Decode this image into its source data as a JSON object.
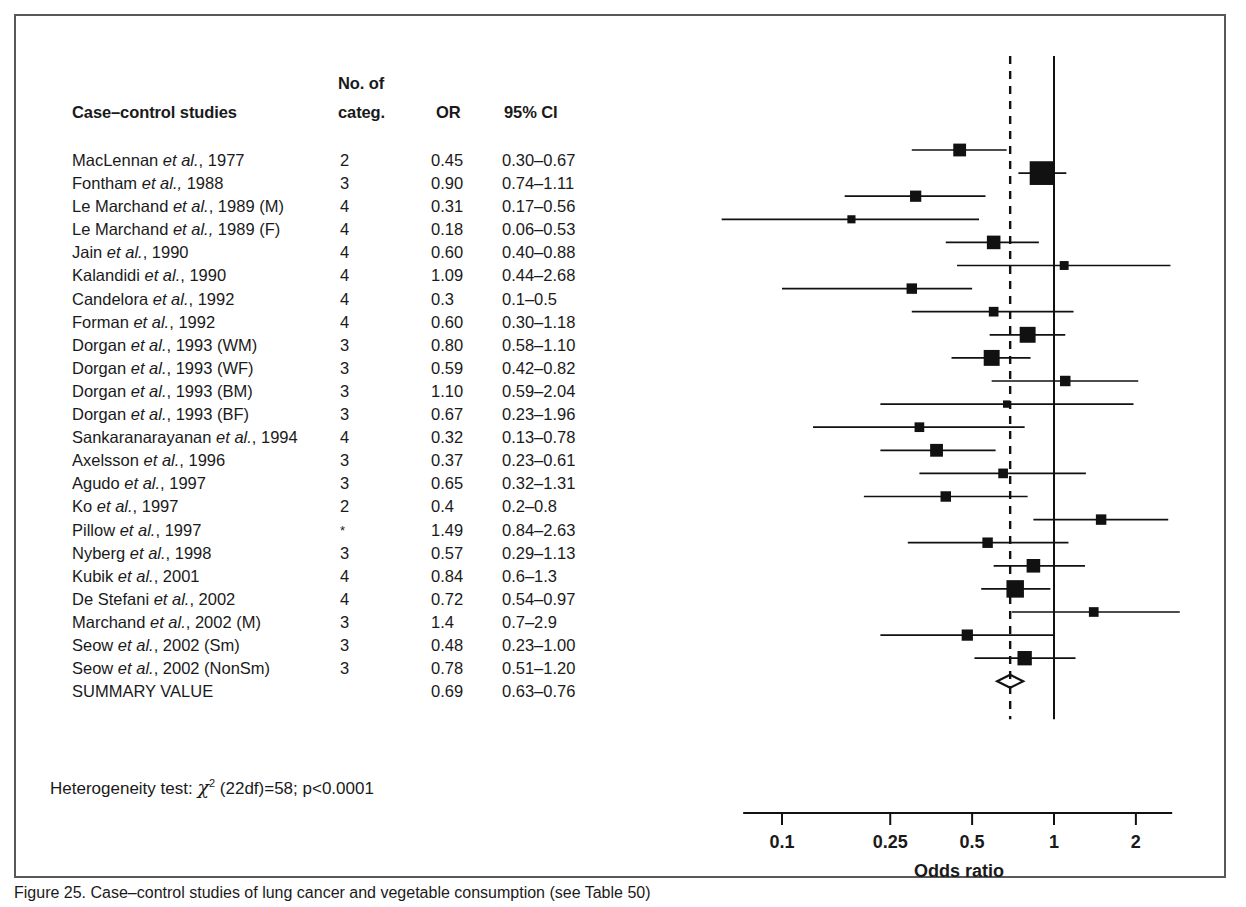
{
  "figure": {
    "caption": "Figure 25. Case–control studies of lung cancer and vegetable consumption (see Table 50)"
  },
  "table": {
    "headers": {
      "studies": "Case–control studies",
      "no_of": "No. of",
      "categ": "categ.",
      "or": "OR",
      "ci": "95% CI"
    }
  },
  "heterogeneity": {
    "prefix": "Heterogeneity test:",
    "chi": "χ",
    "sup": "2",
    "rest": "(22df)=58; p<0.0001"
  },
  "axis": {
    "label": "Odds ratio",
    "ticks": [
      "0.1",
      "0.25",
      "0.5",
      "1",
      "2"
    ],
    "tick_values": [
      0.1,
      0.25,
      0.5,
      1,
      2
    ],
    "scale": "log",
    "null_line": 1.0,
    "summary_line": 0.69
  },
  "chart_data": {
    "type": "forest",
    "title": "Case–control studies of lung cancer and vegetable consumption",
    "xlabel": "Odds ratio",
    "xscale": "log",
    "xlim": [
      0.07,
      2.6
    ],
    "xticks": [
      0.1,
      0.25,
      0.5,
      1,
      2
    ],
    "reference_line": 1.0,
    "summary_line": 0.69,
    "grid": false,
    "legend": "none",
    "rows": [
      {
        "study": "MacLennan ",
        "italic": "et al.",
        "tail": ", 1977",
        "categ": "2",
        "or": "0.45",
        "ci": "0.30–0.67",
        "lo": 0.3,
        "hi": 0.67,
        "est": 0.45,
        "weight": 10
      },
      {
        "study": "Fontham ",
        "italic": "et al.,",
        "tail": " 1988",
        "categ": "3",
        "or": "0.90",
        "ci": "0.74–1.11",
        "lo": 0.74,
        "hi": 1.11,
        "est": 0.9,
        "weight": 24
      },
      {
        "study": "Le Marchand ",
        "italic": "et al.",
        "tail": ", 1989 (M)",
        "categ": "4",
        "or": "0.31",
        "ci": "0.17–0.56",
        "lo": 0.17,
        "hi": 0.56,
        "est": 0.31,
        "weight": 8
      },
      {
        "study": "Le Marchand ",
        "italic": "et al.,",
        "tail": " 1989 (F)",
        "categ": "4",
        "or": "0.18",
        "ci": "0.06–0.53",
        "lo": 0.06,
        "hi": 0.53,
        "est": 0.18,
        "weight": 4
      },
      {
        "study": "Jain ",
        "italic": "et al.",
        "tail": ", 1990",
        "categ": "4",
        "or": "0.60",
        "ci": "0.40–0.88",
        "lo": 0.4,
        "hi": 0.88,
        "est": 0.6,
        "weight": 11
      },
      {
        "study": "Kalandidi ",
        "italic": "et al.",
        "tail": ", 1990",
        "categ": "4",
        "or": "1.09",
        "ci": "0.44–2.68",
        "lo": 0.44,
        "hi": 2.68,
        "est": 1.09,
        "weight": 5
      },
      {
        "study": "Candelora ",
        "italic": "et al.",
        "tail": ", 1992",
        "categ": "4",
        "or": "0.3",
        "ci": "0.1–0.5",
        "lo": 0.1,
        "hi": 0.5,
        "est": 0.3,
        "weight": 7
      },
      {
        "study": "Forman ",
        "italic": "et al.",
        "tail": ", 1992",
        "categ": "4",
        "or": "0.60",
        "ci": "0.30–1.18",
        "lo": 0.3,
        "hi": 1.18,
        "est": 0.6,
        "weight": 6
      },
      {
        "study": "Dorgan ",
        "italic": "et al.",
        "tail": ", 1993 (WM)",
        "categ": "3",
        "or": "0.80",
        "ci": "0.58–1.10",
        "lo": 0.58,
        "hi": 1.1,
        "est": 0.8,
        "weight": 14
      },
      {
        "study": "Dorgan ",
        "italic": "et al.",
        "tail": ", 1993 (WF)",
        "categ": "3",
        "or": "0.59",
        "ci": "0.42–0.82",
        "lo": 0.42,
        "hi": 0.82,
        "est": 0.59,
        "weight": 14
      },
      {
        "study": "Dorgan ",
        "italic": "et al.",
        "tail": ", 1993 (BM)",
        "categ": "3",
        "or": "1.10",
        "ci": "0.59–2.04",
        "lo": 0.59,
        "hi": 2.04,
        "est": 1.1,
        "weight": 7
      },
      {
        "study": "Dorgan ",
        "italic": "et al.",
        "tail": ", 1993 (BF)",
        "categ": "3",
        "or": "0.67",
        "ci": "0.23–1.96",
        "lo": 0.23,
        "hi": 1.96,
        "est": 0.67,
        "weight": 3
      },
      {
        "study": "Sankaranarayanan ",
        "italic": "et al.",
        "tail": ", 1994",
        "categ": "4",
        "or": "0.32",
        "ci": "0.13–0.78",
        "lo": 0.13,
        "hi": 0.78,
        "est": 0.32,
        "weight": 6
      },
      {
        "study": "Axelsson ",
        "italic": "et al.",
        "tail": ", 1996",
        "categ": "3",
        "or": "0.37",
        "ci": "0.23–0.61",
        "lo": 0.23,
        "hi": 0.61,
        "est": 0.37,
        "weight": 10
      },
      {
        "study": "Agudo ",
        "italic": "et al.",
        "tail": ", 1997",
        "categ": "3",
        "or": "0.65",
        "ci": "0.32–1.31",
        "lo": 0.32,
        "hi": 1.31,
        "est": 0.65,
        "weight": 6
      },
      {
        "study": "Ko ",
        "italic": "et al.",
        "tail": ", 1997",
        "categ": "2",
        "or": "0.4",
        "ci": "0.2–0.8",
        "lo": 0.2,
        "hi": 0.8,
        "est": 0.4,
        "weight": 7
      },
      {
        "study": "Pillow ",
        "italic": "et al.",
        "tail": ", 1997",
        "categ": "*",
        "or": "1.49",
        "ci": "0.84–2.63",
        "lo": 0.84,
        "hi": 2.63,
        "est": 1.49,
        "weight": 7
      },
      {
        "study": "Nyberg ",
        "italic": "et al.",
        "tail": ", 1998",
        "categ": "3",
        "or": "0.57",
        "ci": "0.29–1.13",
        "lo": 0.29,
        "hi": 1.13,
        "est": 0.57,
        "weight": 7
      },
      {
        "study": "Kubik ",
        "italic": "et al.",
        "tail": ", 2001",
        "categ": "4",
        "or": "0.84",
        "ci": "0.6–1.3",
        "lo": 0.6,
        "hi": 1.3,
        "est": 0.84,
        "weight": 11
      },
      {
        "study": "De Stefani ",
        "italic": "et al.",
        "tail": ", 2002",
        "categ": "4",
        "or": "0.72",
        "ci": "0.54–0.97",
        "lo": 0.54,
        "hi": 0.97,
        "est": 0.72,
        "weight": 16
      },
      {
        "study": "Marchand ",
        "italic": "et al.",
        "tail": ", 2002 (M)",
        "categ": "3",
        "or": "1.4",
        "ci": "0.7–2.9",
        "lo": 0.7,
        "hi": 2.9,
        "est": 1.4,
        "weight": 6
      },
      {
        "study": "Seow ",
        "italic": "et al.",
        "tail": ", 2002 (Sm)",
        "categ": "3",
        "or": "0.48",
        "ci": "0.23–1.00",
        "lo": 0.23,
        "hi": 1.0,
        "est": 0.48,
        "weight": 8
      },
      {
        "study": "Seow ",
        "italic": "et al.",
        "tail": ", 2002 (NonSm)",
        "categ": "3",
        "or": "0.78",
        "ci": "0.51–1.20",
        "lo": 0.51,
        "hi": 1.2,
        "est": 0.78,
        "weight": 12
      },
      {
        "study": "SUMMARY VALUE",
        "italic": "",
        "tail": "",
        "categ": "",
        "or": "0.69",
        "ci": "0.63–0.76",
        "lo": 0.63,
        "hi": 0.76,
        "est": 0.69,
        "weight": 0,
        "summary": true
      }
    ]
  }
}
